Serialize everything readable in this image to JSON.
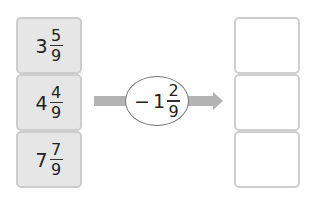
{
  "inputs": [
    {
      "whole": "3",
      "numerator": "5",
      "denominator": "9"
    },
    {
      "whole": "4",
      "numerator": "4",
      "denominator": "9"
    },
    {
      "whole": "7",
      "numerator": "7",
      "denominator": "9"
    }
  ],
  "operation": {
    "sign": "−",
    "whole": "1",
    "numerator": "2",
    "denominator": "9"
  },
  "outputs": [
    "",
    "",
    ""
  ],
  "colors": {
    "input_fill": "#e6e6e6",
    "input_border": "#cdcdcd",
    "arrow": "#b3b3b3",
    "output_border": "#cfcfcf"
  }
}
